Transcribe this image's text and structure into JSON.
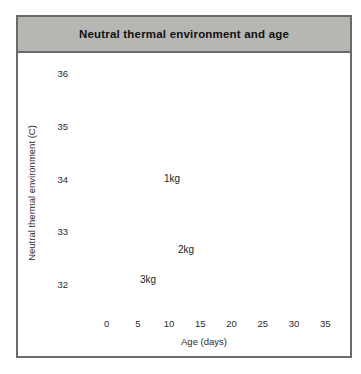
{
  "title": "Neutral thermal environment and age",
  "colors": {
    "title_bar": "#b6b7b3",
    "card_border": "#6a6a6a",
    "plot_bg": "#ededec",
    "band_dark": "#b3b5b1",
    "band_light": "#d9dbd5",
    "axis": "#3c3c3c",
    "text": "#2a2a2a"
  },
  "chart_data": {
    "type": "area",
    "title": "Neutral thermal environment and age",
    "xlabel": "Age (days)",
    "ylabel": "Neutral thermal environment (C)",
    "xlim": [
      0,
      35
    ],
    "ylim": [
      31.5,
      36
    ],
    "x_ticks": [
      0,
      5,
      10,
      15,
      20,
      25,
      30,
      35
    ],
    "y_ticks": [
      36,
      35,
      34,
      33,
      32
    ],
    "y_minor_ticks": [
      35.5,
      34.5,
      33.5,
      32.5,
      31.5
    ],
    "grid": false,
    "legend": "labels drawn on bands",
    "bands": [
      {
        "label": "1kg",
        "color_key": "band_dark",
        "opacity": 1,
        "upper": [
          [
            0,
            34.9
          ],
          [
            3,
            34.76
          ],
          [
            6,
            34.62
          ],
          [
            9,
            34.45
          ],
          [
            12,
            34.2
          ],
          [
            15,
            34.0
          ],
          [
            18,
            33.72
          ],
          [
            21,
            33.48
          ],
          [
            24,
            33.35
          ],
          [
            27,
            33.25
          ],
          [
            30,
            33.2
          ],
          [
            33,
            33.24
          ],
          [
            35.3,
            33.3
          ]
        ],
        "lower": [
          [
            0,
            34.4
          ],
          [
            3,
            34.26
          ],
          [
            6,
            34.07
          ],
          [
            9,
            33.85
          ],
          [
            12,
            33.6
          ],
          [
            15,
            33.35
          ],
          [
            18,
            33.12
          ],
          [
            21,
            32.97
          ],
          [
            24,
            32.85
          ],
          [
            27,
            32.76
          ],
          [
            30,
            32.7
          ],
          [
            33,
            32.62
          ],
          [
            35.3,
            32.5
          ]
        ]
      },
      {
        "label": "2kg",
        "color_key": "band_light",
        "opacity": 0.78,
        "upper": [
          [
            0,
            34.05
          ],
          [
            2,
            33.8
          ],
          [
            4,
            33.55
          ],
          [
            6,
            33.35
          ],
          [
            8,
            33.17
          ],
          [
            10,
            33.05
          ],
          [
            13,
            32.95
          ],
          [
            16,
            32.86
          ],
          [
            19,
            32.8
          ],
          [
            22,
            32.76
          ],
          [
            25,
            32.72
          ],
          [
            27,
            32.7
          ],
          [
            28.8,
            32.62
          ],
          [
            29.6,
            32.45
          ],
          [
            29.9,
            32.25
          ]
        ],
        "lower": [
          [
            0,
            33.4
          ],
          [
            2,
            33.15
          ],
          [
            4,
            32.95
          ],
          [
            6,
            32.8
          ],
          [
            8,
            32.66
          ],
          [
            10,
            32.56
          ],
          [
            13,
            32.45
          ],
          [
            16,
            32.3
          ],
          [
            19,
            32.2
          ],
          [
            22,
            32.15
          ],
          [
            25,
            32.1
          ],
          [
            27,
            32.06
          ],
          [
            29.2,
            32.05
          ]
        ]
      },
      {
        "label": "3kg",
        "color_key": "band_dark",
        "opacity": 1,
        "upper": [
          [
            0,
            33.85
          ],
          [
            1,
            33.62
          ],
          [
            2,
            33.32
          ],
          [
            3,
            33.02
          ],
          [
            4.5,
            32.76
          ],
          [
            6,
            32.6
          ],
          [
            8,
            32.5
          ],
          [
            10,
            32.43
          ],
          [
            11,
            32.35
          ],
          [
            11.15,
            32.1
          ],
          [
            11.35,
            31.92
          ],
          [
            11.6,
            31.78
          ]
        ],
        "lower": [
          [
            0,
            33.3
          ],
          [
            0.5,
            33.0
          ],
          [
            1,
            32.72
          ],
          [
            2,
            32.3
          ],
          [
            3.5,
            32.0
          ],
          [
            5,
            31.8
          ],
          [
            6.5,
            31.7
          ],
          [
            8.5,
            31.63
          ],
          [
            10.5,
            31.65
          ],
          [
            11.6,
            31.78
          ]
        ]
      }
    ]
  }
}
